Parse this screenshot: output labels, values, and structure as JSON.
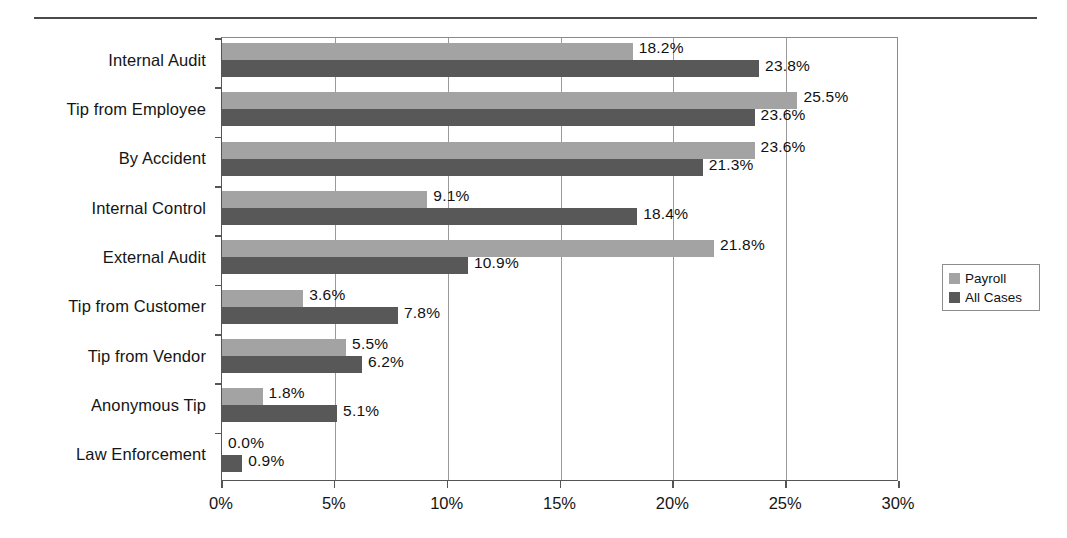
{
  "chart_data": {
    "type": "bar",
    "orientation": "horizontal",
    "title": "",
    "subtitle": "",
    "xlabel": "",
    "ylabel": "",
    "xlim": [
      0,
      30
    ],
    "xtick_labels": [
      "0%",
      "5%",
      "10%",
      "15%",
      "20%",
      "25%",
      "30%"
    ],
    "xtick_values": [
      0,
      5,
      10,
      15,
      20,
      25,
      30
    ],
    "grid": true,
    "grid_axis": "x",
    "legend_position": "right-outside",
    "categories": [
      "Internal Audit",
      "Tip from Employee",
      "By Accident",
      "Internal Control",
      "External Audit",
      "Tip from Customer",
      "Tip from Vendor",
      "Anonymous Tip",
      "Law Enforcement"
    ],
    "series": [
      {
        "name": "Payroll",
        "color": "#a3a3a3",
        "values": [
          18.2,
          25.5,
          23.6,
          9.1,
          21.8,
          3.6,
          5.5,
          1.8,
          0.0
        ],
        "labels": [
          "18.2%",
          "25.5%",
          "23.6%",
          "9.1%",
          "21.8%",
          "3.6%",
          "5.5%",
          "1.8%",
          "0.0%"
        ]
      },
      {
        "name": "All Cases",
        "color": "#585858",
        "values": [
          23.8,
          23.6,
          21.3,
          18.4,
          10.9,
          7.8,
          6.2,
          5.1,
          0.9
        ],
        "labels": [
          "23.8%",
          "23.6%",
          "21.3%",
          "18.4%",
          "10.9%",
          "7.8%",
          "6.2%",
          "5.1%",
          "0.9%"
        ]
      }
    ]
  },
  "legend": {
    "items": [
      {
        "label": "Payroll",
        "color": "#a3a3a3"
      },
      {
        "label": "All Cases",
        "color": "#585858"
      }
    ]
  }
}
